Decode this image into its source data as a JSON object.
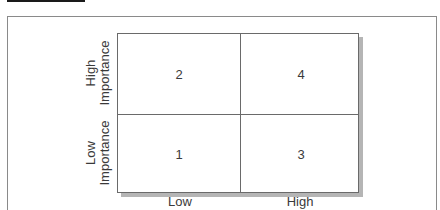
{
  "diagram": {
    "type": "2x2 matrix",
    "y_axis": {
      "labels": [
        {
          "line1": "High",
          "line2": "Importance"
        },
        {
          "line1": "Low",
          "line2": "Importance"
        }
      ]
    },
    "x_axis": {
      "labels": [
        "Low",
        "High"
      ]
    },
    "cells": {
      "top_left": "2",
      "top_right": "4",
      "bottom_left": "1",
      "bottom_right": "3"
    }
  }
}
